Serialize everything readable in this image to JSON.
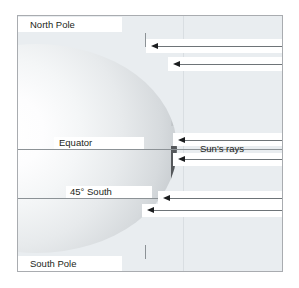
{
  "figure": {
    "type": "diagram",
    "background_color": "#ffffff",
    "panel": {
      "background_color": "#e9edf0",
      "border_color": "#a9acb0"
    }
  },
  "labels": {
    "north_pole": "North Pole",
    "equator": "Equator",
    "latitude_45_south": "45° South",
    "south_pole": "South Pole",
    "suns_rays": "Sun's rays"
  },
  "globe": {
    "name": "earth-sphere",
    "highlight_color": "#ffffff",
    "shadow_color": "#b3b8bd",
    "terminator_color": "#55585b"
  },
  "rays": {
    "label": "Sun's rays",
    "direction": "right-to-left",
    "color": "#6e7478",
    "arrowhead_color": "#1b1d1f",
    "count": 6,
    "items": [
      {
        "id": "ray-1",
        "y": 45,
        "target": "north-pole-region"
      },
      {
        "id": "ray-2",
        "y": 63,
        "target": "high-northern-latitude"
      },
      {
        "id": "ray-3",
        "y": 139,
        "target": "equator-north-side"
      },
      {
        "id": "ray-4",
        "y": 158,
        "target": "equator-south-side"
      },
      {
        "id": "ray-5",
        "y": 197,
        "target": "45-south-upper"
      },
      {
        "id": "ray-6",
        "y": 209,
        "target": "45-south-lower"
      }
    ]
  },
  "latitudes": [
    {
      "id": "equator-line",
      "label": "Equator",
      "y": 148
    },
    {
      "id": "lat-45-south-line",
      "label": "45° South",
      "y": 197
    }
  ],
  "poles": [
    {
      "id": "north-pole",
      "label": "North Pole",
      "y": 31
    },
    {
      "id": "south-pole",
      "label": "South Pole",
      "y": 263
    }
  ]
}
